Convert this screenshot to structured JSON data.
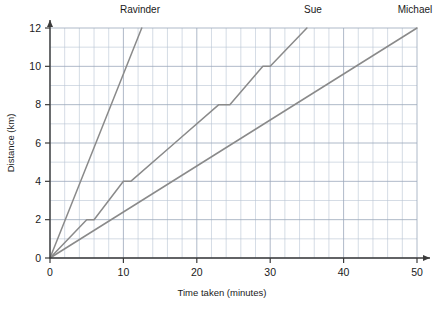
{
  "chart_data": {
    "type": "line",
    "title": "",
    "xlabel": "Time taken (minutes)",
    "ylabel": "Distance (km)",
    "xlim": [
      0,
      52
    ],
    "ylim": [
      0,
      12
    ],
    "xticks": [
      0,
      10,
      20,
      30,
      40,
      50
    ],
    "yticks": [
      0,
      2,
      4,
      6,
      8,
      10,
      12
    ],
    "xtick_labels": [
      "0",
      "10",
      "20",
      "30",
      "40",
      "50"
    ],
    "ytick_labels": [
      "0",
      "2",
      "4",
      "6",
      "8",
      "10",
      "12"
    ],
    "x_minor_step": 2,
    "y_minor_step": 1,
    "grid": true,
    "legend_position": "above-plot-inline",
    "line_color": "#8a8a8a",
    "grid_color": "#b9c4d4",
    "axis_color": "#3b3b3b",
    "series": [
      {
        "name": "Ravinder",
        "label_x": 12.5,
        "points": [
          [
            0,
            0
          ],
          [
            12.5,
            12
          ]
        ]
      },
      {
        "name": "Sue",
        "label_x": 35,
        "points": [
          [
            0,
            0
          ],
          [
            5,
            2
          ],
          [
            6,
            2
          ],
          [
            10,
            4
          ],
          [
            11,
            4
          ],
          [
            17,
            6
          ],
          [
            23,
            8
          ],
          [
            24.5,
            8
          ],
          [
            29,
            10
          ],
          [
            30,
            10
          ],
          [
            35,
            12
          ]
        ]
      },
      {
        "name": "Michael",
        "label_x": 50,
        "points": [
          [
            0,
            0
          ],
          [
            50,
            12
          ]
        ]
      }
    ]
  },
  "labels": {
    "ravinder": "Ravinder",
    "sue": "Sue",
    "michael": "Michael",
    "x_axis_title": "Time taken (minutes)",
    "y_axis_title": "Distance (km)",
    "x0": "0",
    "x10": "10",
    "x20": "20",
    "x30": "30",
    "x40": "40",
    "x50": "50",
    "y0": "0",
    "y2": "2",
    "y4": "4",
    "y6": "6",
    "y8": "8",
    "y10": "10",
    "y12": "12"
  }
}
